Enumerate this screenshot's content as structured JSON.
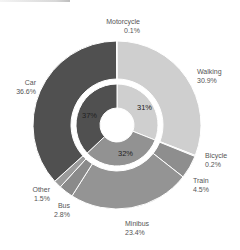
{
  "chart_data": {
    "type": "pie",
    "subtype": "nested-donut",
    "title": "",
    "center": [
      117,
      125
    ],
    "outer_ring": {
      "radius_inner": 46,
      "radius_outer": 84,
      "start_angle_deg": 0,
      "direction": "clockwise-from-top",
      "categories": [
        "Walking",
        "Bicycle",
        "Train",
        "Minibus",
        "Bus",
        "Other",
        "Car",
        "Motorcycle"
      ],
      "values": [
        30.9,
        0.2,
        4.5,
        23.4,
        2.8,
        1.5,
        36.6,
        0.1
      ],
      "labels": [
        "30.9%",
        "0.2%",
        "4.5%",
        "23.4%",
        "2.8%",
        "1.5%",
        "36.6%",
        "0.1%"
      ],
      "colors": [
        "#cfcfcf",
        "#c4c4c4",
        "#8e8e8e",
        "#949494",
        "#8a8a8a",
        "#9a9a9a",
        "#505050",
        "#4a4a4a"
      ]
    },
    "inner_ring": {
      "radius_inner": 17,
      "radius_outer": 41,
      "groups": [
        "Active",
        "Public",
        "Private"
      ],
      "values": [
        31,
        32,
        37
      ],
      "labels": [
        "31%",
        "32%",
        "37%"
      ],
      "colors": [
        "#cfcfcf",
        "#929292",
        "#505050"
      ]
    },
    "legend": "none"
  },
  "labels": {
    "motorcycle": {
      "name": "Motorcycle",
      "value": "0.1%"
    },
    "walking": {
      "name": "Walking",
      "value": "30.9%"
    },
    "car": {
      "name": "Car",
      "value": "36.6%"
    },
    "bicycle": {
      "name": "Bicycle",
      "value": "0.2%"
    },
    "train": {
      "name": "Train",
      "value": "4.5%"
    },
    "other": {
      "name": "Other",
      "value": "1.5%"
    },
    "bus": {
      "name": "Bus",
      "value": "2.8%"
    },
    "minibus": {
      "name": "Minibus",
      "value": "23.4%"
    }
  },
  "inner_labels": {
    "active": "31%",
    "public": "32%",
    "private": "37%"
  }
}
